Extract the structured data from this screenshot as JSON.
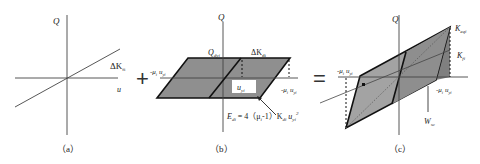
{
  "figure": {
    "panels": [
      {
        "id": "a",
        "caption": "（a）",
        "axis_y_label": "Q",
        "axis_x_label": "u",
        "line_label": "ΔK",
        "line_label_sub": "fi"
      },
      {
        "id": "b",
        "caption": "（b）",
        "axis_y_label": "Q",
        "top_left_label": "Q",
        "top_left_label_sub": "dyi",
        "top_right_label": "ΔK",
        "top_right_label_sub": "di",
        "left_label": "-μ",
        "left_label_sub": "i",
        "left_label_tail": " u",
        "left_label_tail_sub": "yi",
        "right_label": "-μ",
        "right_label_sub": "i",
        "right_label_tail": " u",
        "right_label_tail_sub": "yi",
        "box_label": "u",
        "box_label_sub": "yi",
        "energy_formula_lhs": "E",
        "energy_formula_lhs_sub": "di",
        "energy_formula_rhs": " = 4（μ",
        "energy_formula_mu_sub": "i",
        "energy_formula_mid": "-1）K",
        "energy_formula_k_sub": "di",
        "energy_formula_u": " u",
        "energy_formula_u_sub": "yi",
        "energy_formula_sup": "2"
      },
      {
        "id": "c",
        "caption": "（c）",
        "axis_y_label": "Q",
        "upper_right_label": "K",
        "upper_right_label_sub": "eqi",
        "right_label": "K",
        "right_label_sub": "fi",
        "left_label": "-μ",
        "left_label_sub": "i",
        "left_label_tail": " u",
        "left_label_tail_sub": "yi",
        "right_axis_label": "-μ",
        "right_axis_label_sub": "i",
        "right_axis_label_tail": " u",
        "right_axis_label_tail_sub": "yi",
        "bottom_label": "W",
        "bottom_label_sub": "sc"
      }
    ],
    "operators": [
      "+",
      "="
    ],
    "colors": {
      "fill_dark": "#8c8c8c",
      "fill_mid": "#a8a8a8",
      "stroke": "#111111",
      "axis": "#333333"
    }
  }
}
